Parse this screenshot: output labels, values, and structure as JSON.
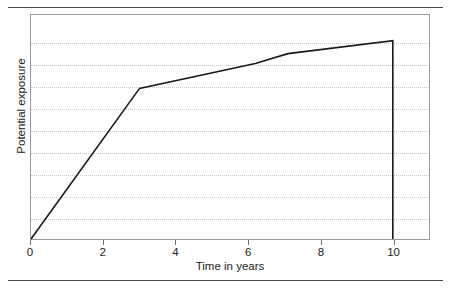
{
  "figure": {
    "width": 451,
    "height": 288,
    "background_color": "#ffffff",
    "rule_color": "#4a4a4a",
    "plot_border_color": "#9a9a9a",
    "gridline_color": "#c8c8c8",
    "line_color": "#1a1a1a"
  },
  "chart_data": {
    "type": "line",
    "title": "",
    "subtitle": "",
    "xlabel": "Time in years",
    "ylabel": "Potential exposure",
    "xlim": [
      0,
      11
    ],
    "ylim": [
      0,
      1.13
    ],
    "xticks": [
      0,
      2,
      4,
      6,
      8,
      10
    ],
    "xtick_labels": [
      "0",
      "2",
      "4",
      "6",
      "8",
      "10"
    ],
    "yticks": [],
    "ytick_labels": [],
    "grid": {
      "horizontal": true,
      "vertical": false,
      "style": "dotted",
      "count": 9,
      "values": [
        0.11,
        0.22,
        0.33,
        0.44,
        0.55,
        0.66,
        0.77,
        0.88,
        0.99
      ]
    },
    "legend": {
      "visible": false,
      "position": "none",
      "entries": []
    },
    "annotations": [],
    "series": [
      {
        "name": "Potential exposure profile",
        "x": [
          0,
          3,
          6.2,
          7.1,
          10,
          10
        ],
        "y": [
          0,
          0.76,
          0.885,
          0.935,
          1.0,
          0
        ]
      }
    ]
  }
}
